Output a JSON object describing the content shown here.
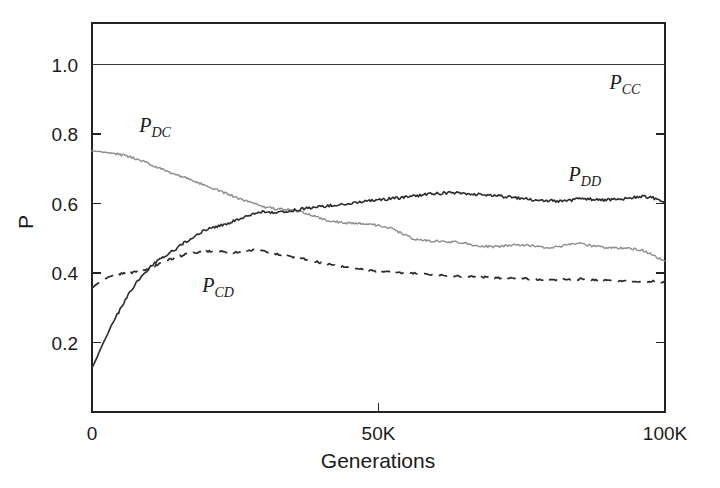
{
  "chart_data": {
    "type": "line",
    "title": "",
    "subtitle": "",
    "xlabel": "Generations",
    "ylabel": "P",
    "xlim": [
      0,
      100000
    ],
    "ylim": [
      0,
      1.12
    ],
    "grid": false,
    "legend_position": "inline-annotations",
    "x_tick_labels": [
      "0",
      "50K",
      "100K"
    ],
    "x_tick_values": [
      0,
      50000,
      100000
    ],
    "y_tick_labels": [
      "0.2",
      "0.4",
      "0.6",
      "0.8",
      "1.0"
    ],
    "y_tick_values": [
      0.2,
      0.4,
      0.6,
      0.8,
      1.0
    ],
    "annotations": [
      {
        "text": "P_CC",
        "base": "P",
        "sub": "CC",
        "x": 93000,
        "y": 0.93
      },
      {
        "text": "P_DD",
        "base": "P",
        "sub": "DD",
        "x": 86000,
        "y": 0.665
      },
      {
        "text": "P_DC",
        "base": "P",
        "sub": "DC",
        "x": 11000,
        "y": 0.805
      },
      {
        "text": "P_CD",
        "base": "P",
        "sub": "CD",
        "x": 22000,
        "y": 0.345
      }
    ],
    "series": [
      {
        "name": "P_CC",
        "label_base": "P",
        "label_sub": "CC",
        "style": "solid",
        "color": "#3a3a3a",
        "x": [
          0,
          100000
        ],
        "values": [
          1.0,
          1.0
        ]
      },
      {
        "name": "P_DD",
        "label_base": "P",
        "label_sub": "DD",
        "style": "solid",
        "color": "#2b2b2b",
        "x": [
          0,
          800,
          1600,
          2400,
          3200,
          4000,
          4800,
          5600,
          6400,
          7200,
          8000,
          8800,
          9600,
          10400,
          11200,
          12000,
          13000,
          14000,
          15000,
          16000,
          17000,
          18000,
          19000,
          20000,
          21500,
          23000,
          24500,
          26000,
          27500,
          29000,
          30500,
          32000,
          34000,
          36000,
          38000,
          40000,
          42000,
          44000,
          46000,
          48000,
          50000,
          52000,
          54000,
          56000,
          58000,
          60000,
          62000,
          64000,
          66000,
          68000,
          70000,
          72000,
          74000,
          76000,
          78000,
          80000,
          82000,
          84000,
          86000,
          88000,
          90000,
          92000,
          94000,
          96000,
          98000,
          100000
        ],
        "values": [
          0.128,
          0.155,
          0.185,
          0.213,
          0.243,
          0.268,
          0.292,
          0.315,
          0.338,
          0.358,
          0.378,
          0.393,
          0.408,
          0.423,
          0.432,
          0.443,
          0.452,
          0.462,
          0.473,
          0.487,
          0.497,
          0.508,
          0.518,
          0.527,
          0.533,
          0.539,
          0.548,
          0.558,
          0.568,
          0.576,
          0.578,
          0.574,
          0.578,
          0.583,
          0.588,
          0.592,
          0.595,
          0.598,
          0.601,
          0.607,
          0.611,
          0.614,
          0.617,
          0.621,
          0.626,
          0.629,
          0.631,
          0.63,
          0.628,
          0.625,
          0.624,
          0.62,
          0.616,
          0.612,
          0.61,
          0.608,
          0.607,
          0.611,
          0.614,
          0.612,
          0.61,
          0.613,
          0.617,
          0.62,
          0.616,
          0.607
        ]
      },
      {
        "name": "P_DC",
        "label_base": "P",
        "label_sub": "DC",
        "style": "solid-light",
        "color": "#8d8d8d",
        "x": [
          0,
          2000,
          4000,
          6000,
          8000,
          10000,
          12000,
          14000,
          16000,
          18000,
          20000,
          22000,
          24000,
          26000,
          28000,
          30000,
          32000,
          34000,
          36000,
          38000,
          40000,
          42000,
          44000,
          46000,
          48000,
          50000,
          52000,
          54000,
          56000,
          58000,
          60000,
          62000,
          64000,
          66000,
          68000,
          70000,
          72000,
          74000,
          76000,
          78000,
          80000,
          82000,
          84000,
          86000,
          88000,
          90000,
          92000,
          94000,
          96000,
          98000,
          100000
        ],
        "values": [
          0.752,
          0.748,
          0.744,
          0.737,
          0.727,
          0.714,
          0.7,
          0.688,
          0.676,
          0.664,
          0.651,
          0.638,
          0.626,
          0.612,
          0.601,
          0.591,
          0.585,
          0.583,
          0.578,
          0.568,
          0.556,
          0.549,
          0.545,
          0.543,
          0.541,
          0.538,
          0.53,
          0.514,
          0.499,
          0.494,
          0.492,
          0.49,
          0.488,
          0.482,
          0.478,
          0.475,
          0.478,
          0.482,
          0.479,
          0.476,
          0.474,
          0.477,
          0.487,
          0.482,
          0.476,
          0.473,
          0.472,
          0.47,
          0.466,
          0.452,
          0.432
        ]
      },
      {
        "name": "P_CD",
        "label_base": "P",
        "label_sub": "CD",
        "style": "dashed",
        "color": "#2b2b2b",
        "x": [
          0,
          2000,
          4000,
          6000,
          8000,
          10000,
          12000,
          14000,
          16000,
          18000,
          20000,
          22000,
          24000,
          26000,
          28000,
          30000,
          32000,
          34000,
          36000,
          38000,
          40000,
          42000,
          44000,
          46000,
          48000,
          50000,
          52000,
          54000,
          56000,
          58000,
          60000,
          62000,
          64000,
          66000,
          68000,
          70000,
          72000,
          74000,
          76000,
          78000,
          80000,
          82000,
          84000,
          86000,
          88000,
          90000,
          92000,
          94000,
          96000,
          98000,
          100000
        ],
        "values": [
          0.357,
          0.382,
          0.396,
          0.4,
          0.404,
          0.412,
          0.428,
          0.442,
          0.452,
          0.458,
          0.462,
          0.463,
          0.458,
          0.461,
          0.466,
          0.462,
          0.456,
          0.45,
          0.444,
          0.437,
          0.43,
          0.423,
          0.417,
          0.412,
          0.408,
          0.405,
          0.403,
          0.401,
          0.399,
          0.397,
          0.395,
          0.393,
          0.391,
          0.39,
          0.389,
          0.387,
          0.386,
          0.385,
          0.384,
          0.382,
          0.38,
          0.381,
          0.382,
          0.383,
          0.381,
          0.379,
          0.378,
          0.377,
          0.376,
          0.376,
          0.375
        ]
      }
    ],
    "plot_frame": {
      "top_border": true,
      "right_border": true,
      "left_border": true,
      "bottom_border": true
    }
  }
}
